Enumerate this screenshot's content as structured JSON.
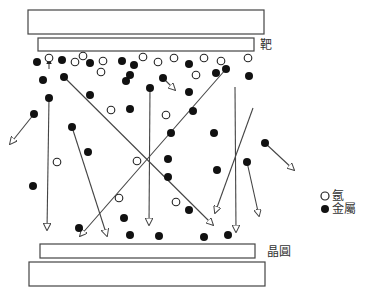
{
  "labels": {
    "target": "靶",
    "wafer": "晶圓"
  },
  "legend": {
    "argon": "氬",
    "metal": "金屬"
  },
  "colors": {
    "stroke": "#444444",
    "metal": "#111111",
    "argon_fill": "#ffffff"
  },
  "plates": {
    "top_outer": {
      "x": 28,
      "y": 10,
      "w": 236,
      "h": 24
    },
    "target": {
      "x": 38,
      "y": 38,
      "w": 216,
      "h": 13
    },
    "wafer": {
      "x": 40,
      "y": 244,
      "w": 215,
      "h": 14
    },
    "bottom_outer": {
      "x": 29,
      "y": 262,
      "w": 236,
      "h": 24
    }
  },
  "argon_atoms": [
    [
      49,
      58
    ],
    [
      75,
      62
    ],
    [
      83,
      56
    ],
    [
      103,
      61
    ],
    [
      101,
      72
    ],
    [
      143,
      57
    ],
    [
      158,
      62
    ],
    [
      174,
      58
    ],
    [
      196,
      75
    ],
    [
      204,
      58
    ],
    [
      221,
      61
    ],
    [
      248,
      58
    ],
    [
      111,
      110
    ],
    [
      166,
      115
    ],
    [
      57,
      162
    ],
    [
      137,
      161
    ],
    [
      119,
      198
    ],
    [
      176,
      202
    ]
  ],
  "metal_atoms": [
    [
      37,
      62
    ],
    [
      62,
      60
    ],
    [
      90,
      63
    ],
    [
      122,
      61
    ],
    [
      134,
      65
    ],
    [
      43,
      80
    ],
    [
      64,
      77
    ],
    [
      130,
      75
    ],
    [
      126,
      81
    ],
    [
      163,
      78
    ],
    [
      189,
      64
    ],
    [
      216,
      73
    ],
    [
      226,
      69
    ],
    [
      249,
      76
    ],
    [
      150,
      88
    ],
    [
      189,
      92
    ],
    [
      49,
      98
    ],
    [
      90,
      95
    ],
    [
      34,
      114
    ],
    [
      130,
      109
    ],
    [
      193,
      111
    ],
    [
      72,
      127
    ],
    [
      171,
      133
    ],
    [
      214,
      133
    ],
    [
      265,
      143
    ],
    [
      88,
      152
    ],
    [
      168,
      159
    ],
    [
      247,
      162
    ],
    [
      168,
      177
    ],
    [
      217,
      170
    ],
    [
      33,
      186
    ],
    [
      189,
      210
    ],
    [
      124,
      218
    ],
    [
      79,
      228
    ],
    [
      130,
      235
    ],
    [
      159,
      236
    ],
    [
      204,
      237
    ],
    [
      228,
      235
    ]
  ],
  "trajectories": [
    {
      "from": [
        49,
        69
      ],
      "to": [
        49,
        59
      ],
      "note": "small arrow up to argon"
    },
    {
      "from": [
        34,
        114
      ],
      "to": [
        10,
        144
      ]
    },
    {
      "from": [
        49,
        98
      ],
      "to": [
        47,
        230
      ]
    },
    {
      "from": [
        64,
        77
      ],
      "to": [
        213,
        225
      ]
    },
    {
      "from": [
        72,
        127
      ],
      "to": [
        107,
        236
      ]
    },
    {
      "from": [
        226,
        69
      ],
      "to": [
        80,
        236
      ]
    },
    {
      "from": [
        150,
        88
      ],
      "to": [
        149,
        225
      ]
    },
    {
      "from": [
        163,
        78
      ],
      "to": [
        175,
        90
      ]
    },
    {
      "from": [
        235,
        87
      ],
      "to": [
        236,
        232
      ]
    },
    {
      "from": [
        253,
        108
      ],
      "to": [
        215,
        213
      ]
    },
    {
      "from": [
        265,
        143
      ],
      "to": [
        294,
        170
      ]
    },
    {
      "from": [
        247,
        162
      ],
      "to": [
        259,
        216
      ]
    }
  ]
}
